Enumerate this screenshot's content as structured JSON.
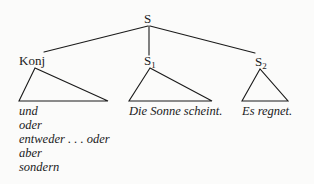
{
  "diagram": {
    "type": "syntax-tree",
    "root": {
      "label": "S",
      "children": [
        {
          "label": "Konj",
          "subscript": "",
          "leaves": [
            "und",
            "oder",
            "entweder . . . oder",
            "aber",
            "sondern"
          ]
        },
        {
          "label": "S",
          "subscript": "1",
          "leaf": "Die Sonne scheint."
        },
        {
          "label": "S",
          "subscript": "2",
          "leaf": "Es regnet."
        }
      ]
    },
    "colors": {
      "line": "#1a1a1a",
      "text": "#1a1a1a",
      "background": "#fbfbfa"
    }
  }
}
